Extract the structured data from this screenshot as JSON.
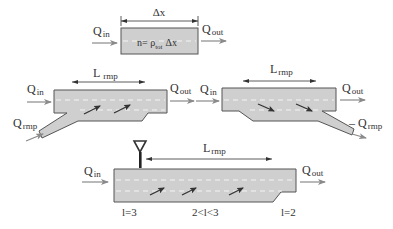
{
  "diagram": {
    "colors": {
      "road_fill": "#cfcfcf",
      "road_border": "#555555",
      "lane_marking": "#f4f4f4",
      "flow_arrow": "#8a8a8a",
      "vehicle_arrow": "#333333",
      "text": "#333333"
    },
    "cell": {
      "length_label": "Δx",
      "q_in": "Q",
      "q_in_sub": "in",
      "q_out": "Q",
      "q_out_sub": "out",
      "formula_n": "n= ρ",
      "formula_sub": "tot",
      "formula_dx": "Δx"
    },
    "on_ramp": {
      "length_label": "L",
      "length_sub": "rmp",
      "q_in": "Q",
      "q_in_sub": "in",
      "q_out": "Q",
      "q_out_sub": "out",
      "q_ramp": "Q",
      "q_ramp_sub": "rmp"
    },
    "off_ramp": {
      "length_label": "L",
      "length_sub": "rmp",
      "q_in": "Q",
      "q_in_sub": "in",
      "q_out": "Q",
      "q_out_sub": "out",
      "q_ramp": "– Q",
      "q_ramp_sub": "rmp"
    },
    "lane_drop": {
      "length_label": "L",
      "length_sub": "rmp",
      "q_in": "Q",
      "q_in_sub": "in",
      "q_out": "Q",
      "q_out_sub": "out",
      "lanes_start": "l=3",
      "lanes_middle": "2<l<3",
      "lanes_end": "l=2",
      "sign_icon": "yield-sign-icon"
    }
  }
}
